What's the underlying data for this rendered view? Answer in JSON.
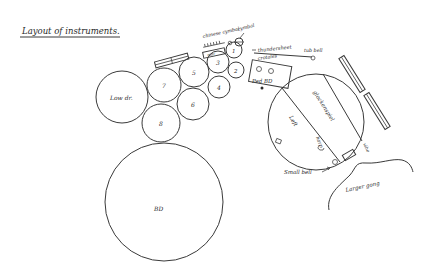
{
  "title": "Layout of instruments.",
  "drums": {
    "low_drum": "Low dr.",
    "bd": "BD",
    "numbered": [
      "1",
      "2",
      "3",
      "4",
      "5",
      "6",
      "7",
      "8"
    ]
  },
  "labels": {
    "chinese_cymbal": "chinese cymbal",
    "cymbal": "cymbal",
    "mar": "mar",
    "thundersheet": "thundersheet",
    "crotales": "crotales",
    "pedal_bd": "Ped BD",
    "tub_bell": "tub bell",
    "glockenspiel": "glockenspiel",
    "harp": "harp",
    "small_bell": "Small bell",
    "large_gong": "Larger gong",
    "vibe": "vibe",
    "left_label": "Left"
  },
  "colors": {
    "ink": "#3a3a3a",
    "paper": "#ffffff"
  }
}
